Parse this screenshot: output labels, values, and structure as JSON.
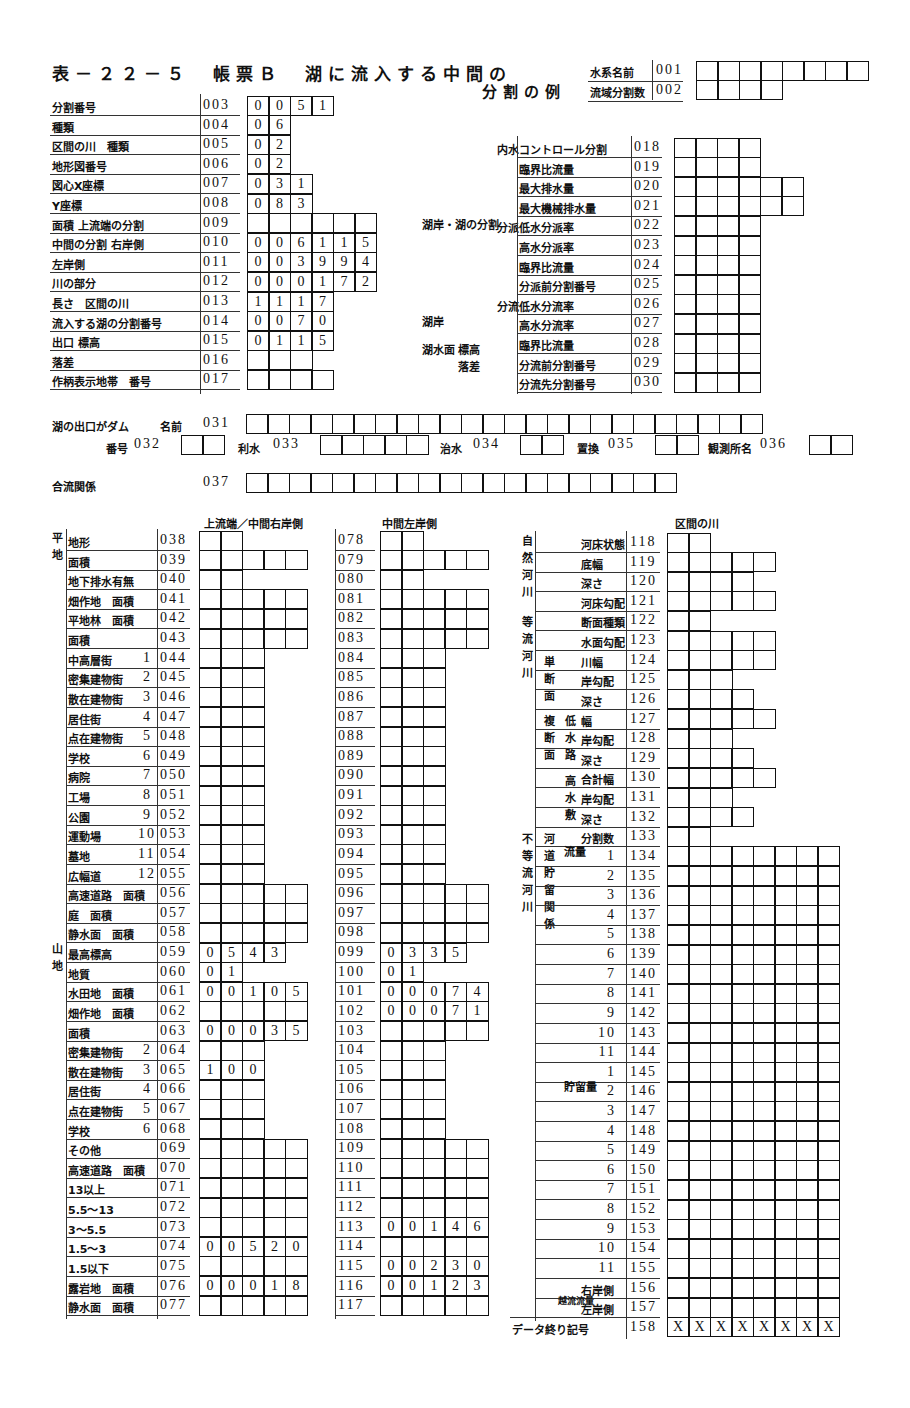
{
  "title": {
    "line1": "表－２２－５　帳票Ｂ　湖に流入する中間の",
    "line2": "分割の例"
  },
  "header_fields": [
    {
      "label": "水系名前",
      "code": "001",
      "cells": [
        "",
        "",
        "",
        "",
        "",
        "",
        "",
        ""
      ]
    },
    {
      "label": "流域分割数",
      "code": "002",
      "cells": [
        "",
        "",
        "",
        ""
      ]
    }
  ],
  "left_top": [
    {
      "label": "分割番号",
      "code": "003",
      "cells": [
        "0",
        "0",
        "5",
        "1"
      ]
    },
    {
      "label": "種類",
      "code": "004",
      "cells": [
        "0",
        "6"
      ]
    },
    {
      "label": "区間の川　種類",
      "code": "005",
      "cells": [
        "0",
        "2"
      ]
    },
    {
      "label": "地形図番号",
      "code": "006",
      "cells": [
        "0",
        "2"
      ]
    },
    {
      "label": "図心X座標",
      "code": "007",
      "cells": [
        "0",
        "3",
        "1"
      ]
    },
    {
      "label": "Y座標",
      "code": "008",
      "cells": [
        "0",
        "8",
        "3"
      ]
    },
    {
      "label": "面積 上流端の分割",
      "code": "009",
      "cells": [
        "",
        "",
        "",
        "",
        "",
        ""
      ]
    },
    {
      "label": "中間の分割 右岸側",
      "code": "010",
      "cells": [
        "0",
        "0",
        "6",
        "1",
        "1",
        "5"
      ]
    },
    {
      "label": "左岸側",
      "code": "011",
      "cells": [
        "0",
        "0",
        "3",
        "9",
        "9",
        "4"
      ]
    },
    {
      "label": "川の部分",
      "code": "012",
      "cells": [
        "0",
        "0",
        "0",
        "1",
        "7",
        "2"
      ]
    },
    {
      "label": "長さ　区間の川",
      "code": "013",
      "cells": [
        "1",
        "1",
        "1",
        "7"
      ]
    },
    {
      "label": "流入する湖の分割番号",
      "code": "014",
      "cells": [
        "0",
        "0",
        "7",
        "0"
      ]
    },
    {
      "label": "出口 標高",
      "code": "015",
      "cells": [
        "0",
        "1",
        "1",
        "5"
      ]
    },
    {
      "label": "落差",
      "code": "016",
      "cells": [
        "",
        "",
        ""
      ]
    },
    {
      "label": "作柄表示地帯　番号",
      "code": "017",
      "cells": [
        "",
        "",
        "",
        ""
      ]
    }
  ],
  "middle_labels": {
    "lake_shore_split": "湖岸・湖の分割",
    "lake_shore": "湖岸",
    "lake_water_level": "湖水面",
    "elevation": "標高",
    "drop": "落差"
  },
  "right_top": [
    {
      "group": "内水",
      "label": "コントロール分割",
      "code": "018",
      "cells": 4
    },
    {
      "label": "臨界比流量",
      "code": "019",
      "cells": 4
    },
    {
      "label": "最大排水量",
      "code": "020",
      "cells": 6
    },
    {
      "label": "最大機械排水量",
      "code": "021",
      "cells": 6
    },
    {
      "group": "分派",
      "label": "低水分派率",
      "code": "022",
      "cells": 4
    },
    {
      "label": "高水分派率",
      "code": "023",
      "cells": 4
    },
    {
      "label": "臨界比流量",
      "code": "024",
      "cells": 4
    },
    {
      "label": "分派前分割番号",
      "code": "025",
      "cells": 4
    },
    {
      "group": "分流",
      "label": "低水分流率",
      "code": "026",
      "cells": 4
    },
    {
      "label": "高水分流率",
      "code": "027",
      "cells": 4
    },
    {
      "label": "臨界比流量",
      "code": "028",
      "cells": 4
    },
    {
      "label": "分流前分割番号",
      "code": "029",
      "cells": 4
    },
    {
      "label": "分流先分割番号",
      "code": "030",
      "cells": 4
    }
  ],
  "dam": {
    "label": "湖の出口がダム",
    "name_label": "名前",
    "name_code": "031",
    "name_cells": 24,
    "number_label": "番号",
    "number_code": "032",
    "number_cells": 2,
    "irrigation_label": "利水",
    "irrigation_code": "033",
    "irrigation_cells": 5,
    "flood_label": "治水",
    "flood_code": "034",
    "flood_cells": 2,
    "setting_label": "置換",
    "setting_code": "035",
    "setting_cells": 2,
    "station_label": "観測所名",
    "station_code": "036",
    "station_cells": 2
  },
  "confluence": {
    "label": "合流関係",
    "code": "037",
    "cells": 20
  },
  "col_headers": {
    "upstream_right": "上流端／中間右岸側",
    "middle_left": "中間左岸側",
    "section_river": "区間の川"
  },
  "group_labels": {
    "flat": "平地",
    "paddy": "水田",
    "urban": "市街地",
    "mountain": "山地",
    "road": "一般道路",
    "natural_river": "自然河川",
    "uniform_river": "等流河川",
    "single_section": "単断面",
    "compound_section": "複断面",
    "low_water": "低水路",
    "high_water": "高水敷",
    "nonuniform_river": "不等流河川",
    "channel_storage": "河道貯留関係",
    "inflow": "流量",
    "storage": "貯留量",
    "overflow": "越流流量"
  },
  "table_left": [
    {
      "label": "地形",
      "sub": "",
      "code": "038",
      "cells": [
        "",
        ""
      ]
    },
    {
      "label": "面積",
      "sub": "",
      "code": "039",
      "cells": [
        "",
        "",
        "",
        "",
        ""
      ]
    },
    {
      "label": "地下排水有無",
      "sub": "",
      "code": "040",
      "cells": [
        "",
        ""
      ]
    },
    {
      "label": "畑作地　面積",
      "sub": "",
      "code": "041",
      "cells": [
        "",
        "",
        "",
        "",
        ""
      ]
    },
    {
      "label": "平地林　面積",
      "sub": "",
      "code": "042",
      "cells": [
        "",
        "",
        "",
        "",
        ""
      ]
    },
    {
      "label": "面積",
      "sub": "",
      "code": "043",
      "cells": [
        "",
        "",
        "",
        "",
        ""
      ]
    },
    {
      "label": "中高層街",
      "sub": "1",
      "code": "044",
      "cells": [
        "",
        "",
        ""
      ]
    },
    {
      "label": "密集建物街",
      "sub": "2",
      "code": "045",
      "cells": [
        "",
        "",
        ""
      ]
    },
    {
      "label": "散在建物街",
      "sub": "3",
      "code": "046",
      "cells": [
        "",
        "",
        ""
      ]
    },
    {
      "label": "居住街",
      "sub": "4",
      "code": "047",
      "cells": [
        "",
        "",
        ""
      ]
    },
    {
      "label": "点在建物街",
      "sub": "5",
      "code": "048",
      "cells": [
        "",
        "",
        ""
      ]
    },
    {
      "label": "学校",
      "sub": "6",
      "code": "049",
      "cells": [
        "",
        "",
        ""
      ]
    },
    {
      "label": "病院",
      "sub": "7",
      "code": "050",
      "cells": [
        "",
        "",
        ""
      ]
    },
    {
      "label": "工場",
      "sub": "8",
      "code": "051",
      "cells": [
        "",
        "",
        ""
      ]
    },
    {
      "label": "公園",
      "sub": "9",
      "code": "052",
      "cells": [
        "",
        "",
        ""
      ]
    },
    {
      "label": "運動場",
      "sub": "10",
      "code": "053",
      "cells": [
        "",
        "",
        ""
      ]
    },
    {
      "label": "墓地",
      "sub": "11",
      "code": "054",
      "cells": [
        "",
        "",
        ""
      ]
    },
    {
      "label": "広幅道",
      "sub": "12",
      "code": "055",
      "cells": [
        "",
        "",
        ""
      ]
    },
    {
      "label": "高速道路　面積",
      "sub": "",
      "code": "056",
      "cells": [
        "",
        "",
        "",
        "",
        ""
      ]
    },
    {
      "label": "庭　面積",
      "sub": "",
      "code": "057",
      "cells": [
        "",
        "",
        "",
        "",
        ""
      ]
    },
    {
      "label": "静水面　面積",
      "sub": "",
      "code": "058",
      "cells": [
        "",
        "",
        "",
        "",
        ""
      ]
    },
    {
      "label": "最高標高",
      "sub": "",
      "code": "059",
      "cells": [
        "0",
        "5",
        "4",
        "3"
      ]
    },
    {
      "label": "地質",
      "sub": "",
      "code": "060",
      "cells": [
        "0",
        "1"
      ]
    },
    {
      "label": "水田地　面積",
      "sub": "",
      "code": "061",
      "cells": [
        "0",
        "0",
        "1",
        "0",
        "5"
      ]
    },
    {
      "label": "畑作地　面積",
      "sub": "",
      "code": "062",
      "cells": [
        "",
        "",
        "",
        "",
        ""
      ]
    },
    {
      "label": "面積",
      "sub": "",
      "code": "063",
      "cells": [
        "0",
        "0",
        "0",
        "3",
        "5"
      ]
    },
    {
      "label": "密集建物街",
      "sub": "2",
      "code": "064",
      "cells": [
        "",
        "",
        ""
      ]
    },
    {
      "label": "散在建物街",
      "sub": "3",
      "code": "065",
      "cells": [
        "1",
        "0",
        "0"
      ]
    },
    {
      "label": "居住街",
      "sub": "4",
      "code": "066",
      "cells": [
        "",
        "",
        ""
      ]
    },
    {
      "label": "点在建物街",
      "sub": "5",
      "code": "067",
      "cells": [
        "",
        "",
        ""
      ]
    },
    {
      "label": "学校",
      "sub": "6",
      "code": "068",
      "cells": [
        "",
        "",
        ""
      ]
    },
    {
      "label": "その他",
      "sub": "",
      "code": "069",
      "cells": [
        "",
        "",
        "",
        "",
        ""
      ]
    },
    {
      "label": "高速道路　面積",
      "sub": "",
      "code": "070",
      "cells": [
        "",
        "",
        "",
        "",
        ""
      ]
    },
    {
      "label": "13以上",
      "sub": "",
      "code": "071",
      "cells": [
        "",
        "",
        "",
        "",
        ""
      ]
    },
    {
      "label": "5.5～13",
      "sub": "",
      "code": "072",
      "cells": [
        "",
        "",
        "",
        "",
        ""
      ]
    },
    {
      "label": "3～5.5",
      "sub": "",
      "code": "073",
      "cells": [
        "",
        "",
        "",
        "",
        ""
      ]
    },
    {
      "label": "1.5～3",
      "sub": "",
      "code": "074",
      "cells": [
        "0",
        "0",
        "5",
        "2",
        "0"
      ]
    },
    {
      "label": "1.5以下",
      "sub": "",
      "code": "075",
      "cells": [
        "",
        "",
        "",
        "",
        ""
      ]
    },
    {
      "label": "露岩地　面積",
      "sub": "",
      "code": "076",
      "cells": [
        "0",
        "0",
        "0",
        "1",
        "8"
      ]
    },
    {
      "label": "静水面　面積",
      "sub": "",
      "code": "077",
      "cells": [
        "",
        "",
        "",
        "",
        ""
      ]
    }
  ],
  "table_middle": [
    {
      "code": "078",
      "cells": [
        "",
        ""
      ]
    },
    {
      "code": "079",
      "cells": [
        "",
        "",
        "",
        "",
        ""
      ]
    },
    {
      "code": "080",
      "cells": [
        "",
        ""
      ]
    },
    {
      "code": "081",
      "cells": [
        "",
        "",
        "",
        "",
        ""
      ]
    },
    {
      "code": "082",
      "cells": [
        "",
        "",
        "",
        "",
        ""
      ]
    },
    {
      "code": "083",
      "cells": [
        "",
        "",
        "",
        "",
        ""
      ]
    },
    {
      "code": "084",
      "cells": [
        "",
        "",
        ""
      ]
    },
    {
      "code": "085",
      "cells": [
        "",
        "",
        ""
      ]
    },
    {
      "code": "086",
      "cells": [
        "",
        "",
        ""
      ]
    },
    {
      "code": "087",
      "cells": [
        "",
        "",
        ""
      ]
    },
    {
      "code": "088",
      "cells": [
        "",
        "",
        ""
      ]
    },
    {
      "code": "089",
      "cells": [
        "",
        "",
        ""
      ]
    },
    {
      "code": "090",
      "cells": [
        "",
        "",
        ""
      ]
    },
    {
      "code": "091",
      "cells": [
        "",
        "",
        ""
      ]
    },
    {
      "code": "092",
      "cells": [
        "",
        "",
        ""
      ]
    },
    {
      "code": "093",
      "cells": [
        "",
        "",
        ""
      ]
    },
    {
      "code": "094",
      "cells": [
        "",
        "",
        ""
      ]
    },
    {
      "code": "095",
      "cells": [
        "",
        "",
        ""
      ]
    },
    {
      "code": "096",
      "cells": [
        "",
        "",
        "",
        "",
        ""
      ]
    },
    {
      "code": "097",
      "cells": [
        "",
        "",
        "",
        "",
        ""
      ]
    },
    {
      "code": "098",
      "cells": [
        "",
        "",
        "",
        "",
        ""
      ]
    },
    {
      "code": "099",
      "cells": [
        "0",
        "3",
        "3",
        "5"
      ]
    },
    {
      "code": "100",
      "cells": [
        "0",
        "1"
      ]
    },
    {
      "code": "101",
      "cells": [
        "0",
        "0",
        "0",
        "7",
        "4"
      ]
    },
    {
      "code": "102",
      "cells": [
        "0",
        "0",
        "0",
        "7",
        "1"
      ]
    },
    {
      "code": "103",
      "cells": [
        "",
        "",
        "",
        "",
        ""
      ]
    },
    {
      "code": "104",
      "cells": [
        "",
        "",
        ""
      ]
    },
    {
      "code": "105",
      "cells": [
        "",
        "",
        ""
      ]
    },
    {
      "code": "106",
      "cells": [
        "",
        "",
        ""
      ]
    },
    {
      "code": "107",
      "cells": [
        "",
        "",
        ""
      ]
    },
    {
      "code": "108",
      "cells": [
        "",
        "",
        ""
      ]
    },
    {
      "code": "109",
      "cells": [
        "",
        "",
        "",
        "",
        ""
      ]
    },
    {
      "code": "110",
      "cells": [
        "",
        "",
        "",
        "",
        ""
      ]
    },
    {
      "code": "111",
      "cells": [
        "",
        "",
        "",
        "",
        ""
      ]
    },
    {
      "code": "112",
      "cells": [
        "",
        "",
        "",
        "",
        ""
      ]
    },
    {
      "code": "113",
      "cells": [
        "0",
        "0",
        "1",
        "4",
        "6"
      ]
    },
    {
      "code": "114",
      "cells": [
        "",
        "",
        "",
        "",
        ""
      ]
    },
    {
      "code": "115",
      "cells": [
        "0",
        "0",
        "2",
        "3",
        "0"
      ]
    },
    {
      "code": "116",
      "cells": [
        "0",
        "0",
        "1",
        "2",
        "3"
      ]
    },
    {
      "code": "117",
      "cells": [
        "",
        "",
        "",
        "",
        ""
      ]
    }
  ],
  "table_right": [
    {
      "label": "河床状態",
      "sub": "",
      "code": "118",
      "cells": 2
    },
    {
      "label": "底幅",
      "sub": "",
      "code": "119",
      "cells": 5
    },
    {
      "label": "深さ",
      "sub": "",
      "code": "120",
      "cells": 4
    },
    {
      "label": "河床勾配",
      "sub": "",
      "code": "121",
      "cells": 5
    },
    {
      "label": "断面種類",
      "sub": "",
      "code": "122",
      "cells": 2
    },
    {
      "label": "水面勾配",
      "sub": "",
      "code": "123",
      "cells": 5
    },
    {
      "label": "川幅",
      "sub": "",
      "code": "124",
      "cells": 5
    },
    {
      "label": "岸勾配",
      "sub": "",
      "code": "125",
      "cells": 3
    },
    {
      "label": "深さ",
      "sub": "",
      "code": "126",
      "cells": 4
    },
    {
      "label": "幅",
      "sub": "",
      "code": "127",
      "cells": 5
    },
    {
      "label": "岸勾配",
      "sub": "",
      "code": "128",
      "cells": 3
    },
    {
      "label": "深さ",
      "sub": "",
      "code": "129",
      "cells": 4
    },
    {
      "label": "合計幅",
      "sub": "",
      "code": "130",
      "cells": 5
    },
    {
      "label": "岸勾配",
      "sub": "",
      "code": "131",
      "cells": 3
    },
    {
      "label": "深さ",
      "sub": "",
      "code": "132",
      "cells": 4
    },
    {
      "label": "分割数",
      "sub": "",
      "code": "133",
      "cells": 2
    },
    {
      "label": "",
      "sub": "1",
      "code": "134",
      "cells": 8
    },
    {
      "label": "",
      "sub": "2",
      "code": "135",
      "cells": 8
    },
    {
      "label": "",
      "sub": "3",
      "code": "136",
      "cells": 8
    },
    {
      "label": "",
      "sub": "4",
      "code": "137",
      "cells": 8
    },
    {
      "label": "",
      "sub": "5",
      "code": "138",
      "cells": 8
    },
    {
      "label": "",
      "sub": "6",
      "code": "139",
      "cells": 8
    },
    {
      "label": "",
      "sub": "7",
      "code": "140",
      "cells": 8
    },
    {
      "label": "",
      "sub": "8",
      "code": "141",
      "cells": 8
    },
    {
      "label": "",
      "sub": "9",
      "code": "142",
      "cells": 8
    },
    {
      "label": "",
      "sub": "10",
      "code": "143",
      "cells": 8
    },
    {
      "label": "",
      "sub": "11",
      "code": "144",
      "cells": 8
    },
    {
      "label": "",
      "sub": "1",
      "code": "145",
      "cells": 8
    },
    {
      "label": "",
      "sub": "2",
      "code": "146",
      "cells": 8
    },
    {
      "label": "",
      "sub": "3",
      "code": "147",
      "cells": 8
    },
    {
      "label": "",
      "sub": "4",
      "code": "148",
      "cells": 8
    },
    {
      "label": "",
      "sub": "5",
      "code": "149",
      "cells": 8
    },
    {
      "label": "",
      "sub": "6",
      "code": "150",
      "cells": 8
    },
    {
      "label": "",
      "sub": "7",
      "code": "151",
      "cells": 8
    },
    {
      "label": "",
      "sub": "8",
      "code": "152",
      "cells": 8
    },
    {
      "label": "",
      "sub": "9",
      "code": "153",
      "cells": 8
    },
    {
      "label": "",
      "sub": "10",
      "code": "154",
      "cells": 8
    },
    {
      "label": "",
      "sub": "11",
      "code": "155",
      "cells": 8
    },
    {
      "label": "右岸側",
      "sub": "",
      "code": "156",
      "cells": 8
    },
    {
      "label": "左岸側",
      "sub": "",
      "code": "157",
      "cells": 8
    }
  ],
  "end_marker": {
    "label": "データ終り記号",
    "code": "158",
    "cells": [
      "X",
      "X",
      "X",
      "X",
      "X",
      "X",
      "X",
      "X"
    ]
  }
}
